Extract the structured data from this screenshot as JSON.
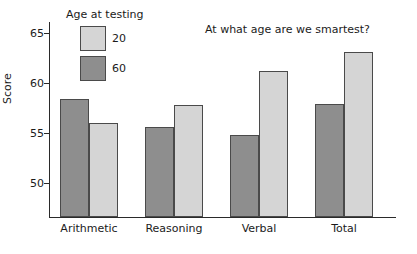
{
  "chart_data": {
    "type": "bar",
    "title": "At what age are we smartest?",
    "xlabel": "",
    "ylabel": "Score",
    "categories": [
      "Arithmetic",
      "Reasoning",
      "Verbal",
      "Total"
    ],
    "series": [
      {
        "name": "60",
        "values": [
          58.3,
          55.5,
          54.7,
          57.8
        ],
        "color": "#8e8e8e"
      },
      {
        "name": "20",
        "values": [
          55.9,
          57.7,
          61.1,
          63.0
        ],
        "color": "#d5d5d5"
      }
    ],
    "ylim": [
      46.5,
      66.1
    ],
    "yticks": [
      50,
      55,
      60,
      65
    ],
    "ytick_labels": [
      "50",
      "55",
      "60",
      "65"
    ],
    "grid": false,
    "legend": {
      "title": "Age at testing",
      "position": "top-left",
      "entries": [
        {
          "label": "20",
          "color": "#d5d5d5"
        },
        {
          "label": "60",
          "color": "#8e8e8e"
        }
      ]
    },
    "bar_order_in_group": [
      "60",
      "20"
    ]
  },
  "axis": {
    "y_title": "Score"
  }
}
